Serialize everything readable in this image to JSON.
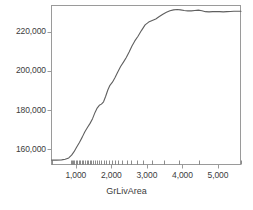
{
  "chart_data": {
    "type": "line",
    "title": "",
    "subtitle": "",
    "xlabel": "GrLivArea",
    "ylabel": "",
    "xlim": [
      300,
      5650
    ],
    "ylim": [
      152000,
      233500
    ],
    "grid": false,
    "legend": null,
    "line_color": "#5f5f5f",
    "frame_color": "#9a9a9a",
    "x_ticks": [
      1000,
      2000,
      3000,
      4000,
      5000
    ],
    "x_tick_labels": [
      "1,000",
      "2,000",
      "3,000",
      "4,000",
      "5,000"
    ],
    "y_ticks": [
      160000,
      180000,
      200000,
      220000
    ],
    "y_tick_labels": [
      "160,000",
      "180,000",
      "200,000",
      "220,000"
    ],
    "x": [
      320,
      450,
      600,
      700,
      800,
      880,
      950,
      1020,
      1100,
      1180,
      1250,
      1330,
      1400,
      1470,
      1540,
      1600,
      1660,
      1720,
      1780,
      1840,
      1900,
      1960,
      2030,
      2100,
      2180,
      2260,
      2340,
      2420,
      2500,
      2580,
      2660,
      2750,
      2850,
      2950,
      3050,
      3150,
      3250,
      3350,
      3450,
      3550,
      3650,
      3750,
      3850,
      3950,
      4050,
      4150,
      4250,
      4350,
      4450,
      4550,
      4650,
      4750,
      4850,
      4950,
      5050,
      5150,
      5250,
      5350,
      5450,
      5560,
      5650
    ],
    "y": [
      154500,
      154500,
      154600,
      154900,
      155600,
      157000,
      158800,
      161000,
      163500,
      166200,
      168800,
      171200,
      173200,
      175600,
      178800,
      181000,
      182400,
      183000,
      184200,
      187000,
      190200,
      192600,
      194200,
      196400,
      199400,
      202200,
      204400,
      206800,
      209600,
      212600,
      215200,
      217600,
      220600,
      223400,
      224800,
      225600,
      226400,
      227600,
      228800,
      229800,
      230600,
      231000,
      231200,
      231000,
      230700,
      230500,
      230500,
      230700,
      230900,
      230600,
      230100,
      230000,
      230100,
      230200,
      230100,
      230000,
      230100,
      230200,
      230300,
      230300,
      230300
    ],
    "rug_values": [
      330,
      860,
      900,
      930,
      960,
      1000,
      1040,
      1080,
      1120,
      1160,
      1200,
      1250,
      1300,
      1340,
      1390,
      1440,
      1490,
      1540,
      1600,
      1660,
      1720,
      1790,
      1860,
      1930,
      2010,
      2100,
      2200,
      2310,
      2430,
      2560,
      2720,
      2900,
      3150,
      3480,
      3900,
      4480,
      5640
    ],
    "rug_label": "data-density-rug"
  },
  "axis": {
    "x_title": "GrLivArea"
  }
}
